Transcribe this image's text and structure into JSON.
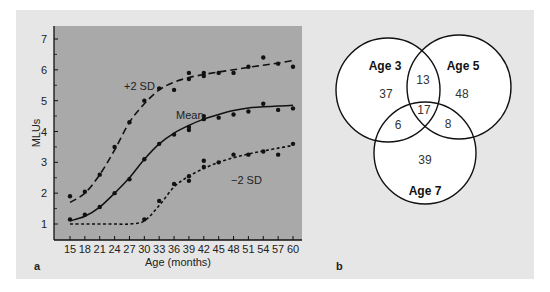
{
  "figure": {
    "panel_a_label": "a",
    "panel_b_label": "b"
  },
  "chart_data": [
    {
      "type": "line",
      "title": "",
      "xlabel": "Age (months)",
      "ylabel": "MLUs",
      "x": [
        15,
        18,
        21,
        24,
        27,
        30,
        33,
        36,
        39,
        42,
        45,
        48,
        51,
        54,
        57,
        60
      ],
      "x_ticks": [
        "15",
        "18",
        "21",
        "24",
        "27",
        "30",
        "33",
        "36",
        "39",
        "42",
        "45",
        "48",
        "51",
        "54",
        "57",
        "60"
      ],
      "y_ticks": [
        "1",
        "2",
        "3",
        "4",
        "5",
        "6",
        "7"
      ],
      "ylim": [
        0.5,
        7.4
      ],
      "xlim": [
        12.3,
        62.5
      ],
      "grid": false,
      "background": "#a9a9a9",
      "series": [
        {
          "name": "+2 SD",
          "label": "+2 SD",
          "style": "dashed",
          "curve": [
            [
              15,
              1.7
            ],
            [
              18,
              2.0
            ],
            [
              21,
              2.6
            ],
            [
              24,
              3.4
            ],
            [
              27,
              4.3
            ],
            [
              30,
              4.9
            ],
            [
              33,
              5.35
            ],
            [
              36,
              5.6
            ],
            [
              39,
              5.75
            ],
            [
              42,
              5.85
            ],
            [
              45,
              5.93
            ],
            [
              48,
              6.0
            ],
            [
              51,
              6.08
            ],
            [
              54,
              6.15
            ],
            [
              57,
              6.22
            ],
            [
              60,
              6.3
            ]
          ],
          "points": [
            [
              15,
              1.9
            ],
            [
              18,
              2.05
            ],
            [
              21,
              2.6
            ],
            [
              24,
              3.5
            ],
            [
              27,
              4.3
            ],
            [
              30,
              5.0
            ],
            [
              33,
              5.4
            ],
            [
              36,
              5.35
            ],
            [
              39,
              5.7
            ],
            [
              39,
              5.9
            ],
            [
              42,
              5.8
            ],
            [
              42,
              5.9
            ],
            [
              45,
              5.9
            ],
            [
              48,
              5.9
            ],
            [
              51,
              6.1
            ],
            [
              54,
              6.4
            ],
            [
              57,
              6.2
            ],
            [
              60,
              6.1
            ]
          ]
        },
        {
          "name": "Mean",
          "label": "Mean",
          "style": "solid",
          "curve": [
            [
              15,
              1.1
            ],
            [
              18,
              1.25
            ],
            [
              21,
              1.55
            ],
            [
              24,
              2.0
            ],
            [
              27,
              2.5
            ],
            [
              30,
              3.1
            ],
            [
              33,
              3.6
            ],
            [
              36,
              3.95
            ],
            [
              39,
              4.2
            ],
            [
              42,
              4.4
            ],
            [
              45,
              4.55
            ],
            [
              48,
              4.68
            ],
            [
              51,
              4.76
            ],
            [
              54,
              4.8
            ],
            [
              57,
              4.83
            ],
            [
              60,
              4.85
            ]
          ],
          "points": [
            [
              15,
              1.15
            ],
            [
              18,
              1.3
            ],
            [
              21,
              1.55
            ],
            [
              24,
              2.0
            ],
            [
              27,
              2.45
            ],
            [
              30,
              3.1
            ],
            [
              33,
              3.6
            ],
            [
              36,
              3.9
            ],
            [
              39,
              4.05
            ],
            [
              39,
              4.15
            ],
            [
              42,
              4.4
            ],
            [
              42,
              4.5
            ],
            [
              45,
              4.45
            ],
            [
              48,
              4.55
            ],
            [
              51,
              4.65
            ],
            [
              54,
              4.9
            ],
            [
              57,
              4.7
            ],
            [
              60,
              4.75
            ]
          ]
        },
        {
          "name": "-2 SD",
          "label": "−2 SD",
          "style": "dotted",
          "curve": [
            [
              15,
              1.0
            ],
            [
              18,
              1.0
            ],
            [
              21,
              1.0
            ],
            [
              24,
              1.0
            ],
            [
              27,
              1.0
            ],
            [
              30,
              1.1
            ],
            [
              33,
              1.6
            ],
            [
              36,
              2.2
            ],
            [
              39,
              2.55
            ],
            [
              42,
              2.8
            ],
            [
              45,
              3.0
            ],
            [
              48,
              3.15
            ],
            [
              51,
              3.27
            ],
            [
              54,
              3.37
            ],
            [
              57,
              3.46
            ],
            [
              60,
              3.55
            ]
          ],
          "points": [
            [
              30,
              1.15
            ],
            [
              33,
              1.75
            ],
            [
              36,
              2.3
            ],
            [
              39,
              2.4
            ],
            [
              39,
              2.55
            ],
            [
              42,
              2.85
            ],
            [
              42,
              3.05
            ],
            [
              45,
              3.0
            ],
            [
              48,
              3.25
            ],
            [
              51,
              3.25
            ],
            [
              54,
              3.35
            ],
            [
              57,
              3.25
            ],
            [
              60,
              3.6
            ]
          ]
        }
      ],
      "annotations": [
        "+2 SD",
        "Mean",
        "−2 SD"
      ]
    },
    {
      "type": "venn",
      "sets": [
        "Age 3",
        "Age 5",
        "Age 7"
      ],
      "regions": {
        "age3_only": 37,
        "age5_only": 48,
        "age7_only": 39,
        "age3_age5": 13,
        "age3_age7": 6,
        "age5_age7": 8,
        "all_three": 17
      }
    }
  ],
  "plot": {
    "xlabel": "Age (months)",
    "ylabel": "MLUs",
    "labels": {
      "plus2sd": "+2 SD",
      "mean": "Mean",
      "minus2sd": "−2 SD"
    }
  },
  "venn": {
    "set_labels": {
      "age3": "Age 3",
      "age5": "Age 5",
      "age7": "Age 7"
    },
    "values": {
      "age3_only": "37",
      "age5_only": "48",
      "age7_only": "39",
      "age3_age5": "13",
      "age3_age7": "6",
      "age5_age7": "8",
      "all_three": "17"
    }
  },
  "colors": {
    "panel_bg": "#e6e6e6",
    "plot_bg": "#a9a9a9",
    "ink": "#111111",
    "circle_fill": "#ffffff"
  }
}
